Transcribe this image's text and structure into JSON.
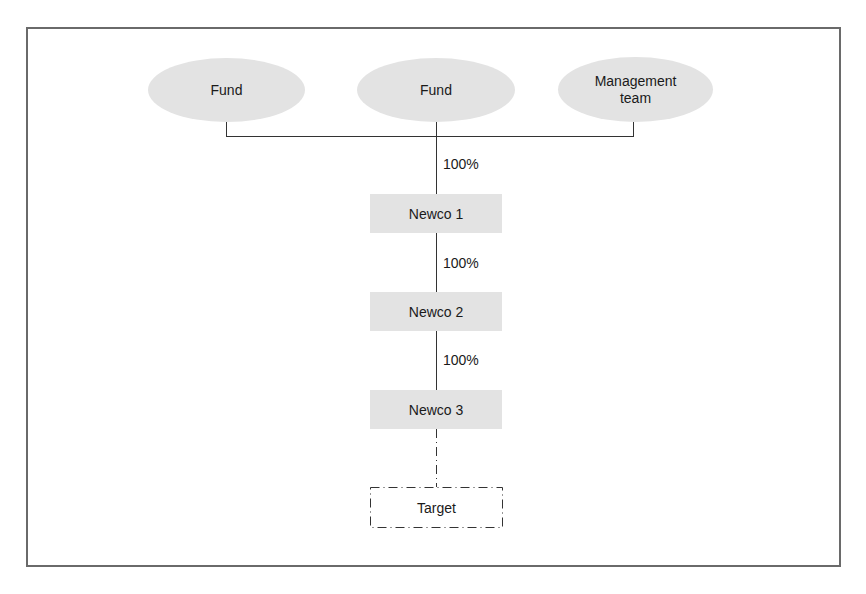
{
  "diagram": {
    "type": "ownership-structure",
    "owners": [
      {
        "label": "Fund"
      },
      {
        "label": "Fund"
      },
      {
        "label": "Management team"
      }
    ],
    "entities": [
      {
        "label": "Newco 1",
        "ownership_above": "100%"
      },
      {
        "label": "Newco 2",
        "ownership_above": "100%"
      },
      {
        "label": "Newco 3",
        "ownership_above": "100%"
      }
    ],
    "target": {
      "label": "Target",
      "link_style": "dash-dot"
    },
    "colors": {
      "shape_fill": "#e3e3e3",
      "line": "#333333",
      "frame": "#6a6a6a"
    }
  }
}
